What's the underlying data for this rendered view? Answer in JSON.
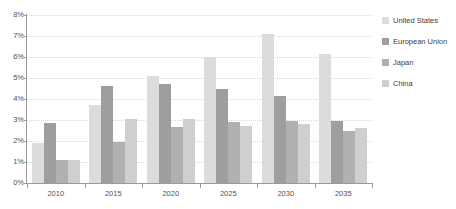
{
  "chart_data": {
    "type": "bar",
    "title": "",
    "subtitle": "",
    "xlabel": "",
    "ylabel": "",
    "categories": [
      "2010",
      "2015",
      "2020",
      "2025",
      "2030",
      "2035"
    ],
    "series": [
      {
        "name": "United States",
        "color": "#dcdcda",
        "values": [
          1.9,
          3.7,
          5.1,
          6.0,
          7.1,
          6.15
        ]
      },
      {
        "name": "European Union",
        "color": "#9e9e9c",
        "values": [
          2.85,
          4.6,
          4.7,
          4.5,
          4.15,
          2.95
        ]
      },
      {
        "name": "Japan",
        "color": "#b0b0ae",
        "values": [
          1.1,
          1.95,
          2.65,
          2.9,
          2.95,
          2.5
        ]
      },
      {
        "name": "China",
        "color": "#cfcfcd",
        "values": [
          1.1,
          3.05,
          3.05,
          2.7,
          2.8,
          2.6
        ]
      }
    ],
    "ylim": [
      0,
      8
    ],
    "ytick_values": [
      0,
      1,
      2,
      3,
      4,
      5,
      6,
      7,
      8
    ],
    "ytick_labels": [
      "0%",
      "1%",
      "2%",
      "3%",
      "4%",
      "5%",
      "6%",
      "7%",
      "8%"
    ],
    "grid": "horizontal-dotted",
    "legend_position": "right",
    "axis_color": "#9a9a9a",
    "gridline_color": "#d8d8d8",
    "background_color": "#ffffff",
    "tick_label_color": "#55524f"
  },
  "legend": {
    "items": [
      {
        "label": "United States",
        "swatch": "legend-swatch-united-states"
      },
      {
        "label": "European Union",
        "swatch": "legend-swatch-european-union"
      },
      {
        "label": "Japan",
        "swatch": "legend-swatch-japan"
      },
      {
        "label": "China",
        "swatch": "legend-swatch-china"
      }
    ]
  }
}
